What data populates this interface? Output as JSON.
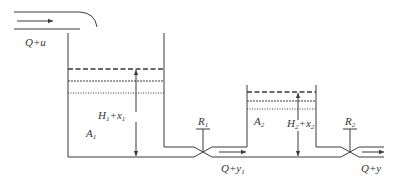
{
  "diagram": {
    "type": "two-tank cascade liquid level system",
    "colors": {
      "stroke": "#3a3a3a",
      "text": "#333333",
      "background": "#ffffff"
    },
    "inflow": {
      "label": "Q+u",
      "arrow": "right-arrow"
    },
    "tank1": {
      "area_label": "A",
      "area_sub": "1",
      "height_label": "H",
      "height_sub": "1",
      "height_plus": "+x",
      "height_plus_sub": "1",
      "levels": [
        "dashed",
        "dense-dotted",
        "sparse-dotted"
      ]
    },
    "valve1": {
      "label": "R",
      "sub": "1"
    },
    "outflow1": {
      "label": "Q+y",
      "sub": "1"
    },
    "tank2": {
      "area_label": "A",
      "area_sub": "2",
      "height_label": "H",
      "height_sub": "2",
      "height_plus": "+x",
      "height_plus_sub": "2",
      "levels": [
        "dashed",
        "dense-dotted",
        "sparse-dotted"
      ]
    },
    "valve2": {
      "label": "R",
      "sub": "2"
    },
    "outflow2": {
      "label": "Q+y"
    }
  }
}
